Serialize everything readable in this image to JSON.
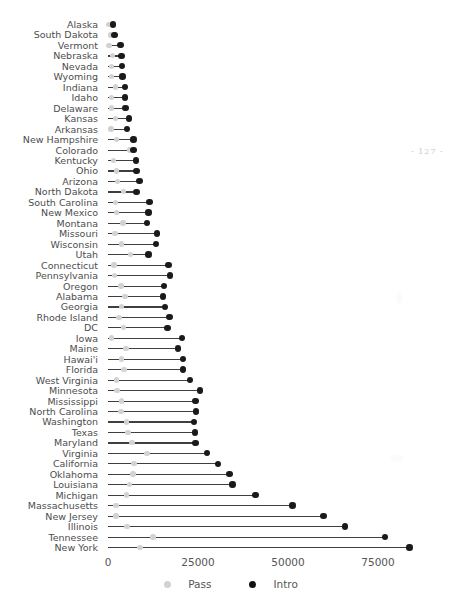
{
  "figure": {
    "page_marker": "- 127 -"
  },
  "chart_data": {
    "type": "dumbbell",
    "title": "",
    "xlabel": "",
    "ylabel": "",
    "xlim": [
      0,
      90000
    ],
    "xticks": [
      0,
      25000,
      50000,
      75000
    ],
    "xticklabels": [
      "0",
      "25000",
      "50000",
      "75000"
    ],
    "grid": false,
    "legend_position": "bottom",
    "series": [
      {
        "name": "Pass",
        "color": "#d2d2d2"
      },
      {
        "name": "Intro",
        "color": "#111111"
      }
    ],
    "categories": [
      "Alaska",
      "South Dakota",
      "Vermont",
      "Nebraska",
      "Nevada",
      "Wyoming",
      "Indiana",
      "Idaho",
      "Delaware",
      "Kansas",
      "Arkansas",
      "New Hampshire",
      "Colorado",
      "Kentucky",
      "Ohio",
      "Arizona",
      "North Dakota",
      "South Carolina",
      "New Mexico",
      "Montana",
      "Missouri",
      "Wisconsin",
      "Utah",
      "Connecticut",
      "Pennsylvania",
      "Oregon",
      "Alabama",
      "Georgia",
      "Rhode Island",
      "DC",
      "Iowa",
      "Maine",
      "Hawai'i",
      "Florida",
      "West Virginia",
      "Minnesota",
      "Mississippi",
      "North Carolina",
      "Washington",
      "Texas",
      "Maryland",
      "Virginia",
      "California",
      "Oklahoma",
      "Louisiana",
      "Michigan",
      "Massachusetts",
      "New Jersey",
      "Illinois",
      "Tennessee",
      "New York"
    ],
    "points": [
      {
        "state": "Alaska",
        "pass": 300,
        "intro": 1400
      },
      {
        "state": "South Dakota",
        "pass": 700,
        "intro": 1800
      },
      {
        "state": "Vermont",
        "pass": 300,
        "intro": 3500
      },
      {
        "state": "Nebraska",
        "pass": 1300,
        "intro": 3700
      },
      {
        "state": "Nevada",
        "pass": 900,
        "intro": 3900
      },
      {
        "state": "Wyoming",
        "pass": 1000,
        "intro": 4000
      },
      {
        "state": "Indiana",
        "pass": 2000,
        "intro": 4700
      },
      {
        "state": "Idaho",
        "pass": 900,
        "intro": 4800
      },
      {
        "state": "Delaware",
        "pass": 900,
        "intro": 4900
      },
      {
        "state": "Kansas",
        "pass": 2100,
        "intro": 5900
      },
      {
        "state": "Arkansas",
        "pass": 800,
        "intro": 5300
      },
      {
        "state": "New Hampshire",
        "pass": 2400,
        "intro": 7100
      },
      {
        "state": "Colorado",
        "pass": 5900,
        "intro": 7100
      },
      {
        "state": "Kentucky",
        "pass": 1500,
        "intro": 7800
      },
      {
        "state": "Ohio",
        "pass": 2300,
        "intro": 7900
      },
      {
        "state": "Arizona",
        "pass": 2600,
        "intro": 8700
      },
      {
        "state": "North Dakota",
        "pass": 4300,
        "intro": 7900
      },
      {
        "state": "South Carolina",
        "pass": 2100,
        "intro": 11500
      },
      {
        "state": "New Mexico",
        "pass": 2400,
        "intro": 11200
      },
      {
        "state": "Montana",
        "pass": 4200,
        "intro": 10900
      },
      {
        "state": "Missouri",
        "pass": 1900,
        "intro": 13600
      },
      {
        "state": "Wisconsin",
        "pass": 3800,
        "intro": 13300
      },
      {
        "state": "Utah",
        "pass": 6200,
        "intro": 11200
      },
      {
        "state": "Connecticut",
        "pass": 1700,
        "intro": 16800
      },
      {
        "state": "Pennsylvania",
        "pass": 1800,
        "intro": 17200
      },
      {
        "state": "Oregon",
        "pass": 3600,
        "intro": 15600
      },
      {
        "state": "Alabama",
        "pass": 4700,
        "intro": 15300
      },
      {
        "state": "Georgia",
        "pass": 3800,
        "intro": 15900
      },
      {
        "state": "Rhode Island",
        "pass": 3100,
        "intro": 17100
      },
      {
        "state": "DC",
        "pass": 4300,
        "intro": 16500
      },
      {
        "state": "Iowa",
        "pass": 1000,
        "intro": 20500
      },
      {
        "state": "Maine",
        "pass": 5000,
        "intro": 19400
      },
      {
        "state": "Hawai'i",
        "pass": 3700,
        "intro": 20900
      },
      {
        "state": "Florida",
        "pass": 4400,
        "intro": 20800
      },
      {
        "state": "West Virginia",
        "pass": 2400,
        "intro": 22800
      },
      {
        "state": "Minnesota",
        "pass": 2500,
        "intro": 25500
      },
      {
        "state": "Mississippi",
        "pass": 3700,
        "intro": 24300
      },
      {
        "state": "North Carolina",
        "pass": 3600,
        "intro": 24400
      },
      {
        "state": "Washington",
        "pass": 5200,
        "intro": 23900
      },
      {
        "state": "Texas",
        "pass": 5600,
        "intro": 24200
      },
      {
        "state": "Maryland",
        "pass": 6700,
        "intro": 24300
      },
      {
        "state": "Virginia",
        "pass": 10800,
        "intro": 27500
      },
      {
        "state": "California",
        "pass": 7200,
        "intro": 30500
      },
      {
        "state": "Oklahoma",
        "pass": 6900,
        "intro": 33800
      },
      {
        "state": "Louisiana",
        "pass": 5900,
        "intro": 34600
      },
      {
        "state": "Michigan",
        "pass": 5100,
        "intro": 41000
      },
      {
        "state": "Massachusetts",
        "pass": 2200,
        "intro": 51300
      },
      {
        "state": "New Jersey",
        "pass": 2200,
        "intro": 59900
      },
      {
        "state": "Illinois",
        "pass": 5300,
        "intro": 65900
      },
      {
        "state": "Tennessee",
        "pass": 12500,
        "intro": 76900
      },
      {
        "state": "New York",
        "pass": 8900,
        "intro": 83800
      }
    ]
  }
}
